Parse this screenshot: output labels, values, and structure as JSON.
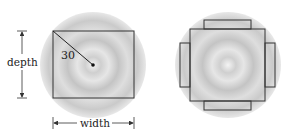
{
  "diagram": {
    "left_figure": {
      "radius_label": "30",
      "depth_label": "depth",
      "width_label": "width"
    },
    "right_figure": {
      "description": "square with four rectangular tabs inscribed in circle"
    },
    "colors": {
      "stroke": "#333333",
      "disc_light": "#f2f2f2",
      "disc_dark": "#b8b8b8",
      "background": "#ffffff"
    }
  }
}
